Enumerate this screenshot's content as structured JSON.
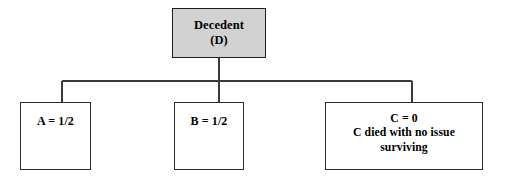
{
  "diagram": {
    "type": "family-tree-intestacy-chart",
    "title_text": "",
    "root": {
      "id": "decedent",
      "label_line1": "Decedent",
      "label_line2": "(D)",
      "fill_color": "#d2d2d2",
      "border_color": "#1d1d1d"
    },
    "children": [
      {
        "id": "child-a",
        "label_line1": "A = 1/2",
        "label_line2": "",
        "label_line3": "",
        "share": "1/2",
        "fill_color": "#ffffff",
        "border_color": "#2b2b2b"
      },
      {
        "id": "child-b",
        "label_line1": "B = 1/2",
        "label_line2": "",
        "label_line3": "",
        "share": "1/2",
        "fill_color": "#ffffff",
        "border_color": "#2b2b2b"
      },
      {
        "id": "child-c",
        "label_line1": "C = 0",
        "label_line2": "C died with no issue",
        "label_line3": "surviving",
        "share": "0",
        "fill_color": "#ffffff",
        "border_color": "#2b2b2b"
      }
    ],
    "connectors": {
      "line_color": "#3a3a3a",
      "stem_x": 219,
      "stem_top_y": 58,
      "bus_y": 81,
      "bus_left_x": 62,
      "bus_right_x": 412,
      "drop_xs": [
        62,
        219,
        412
      ],
      "drop_bottom_y": 102
    },
    "background_color": "#ffffff"
  }
}
